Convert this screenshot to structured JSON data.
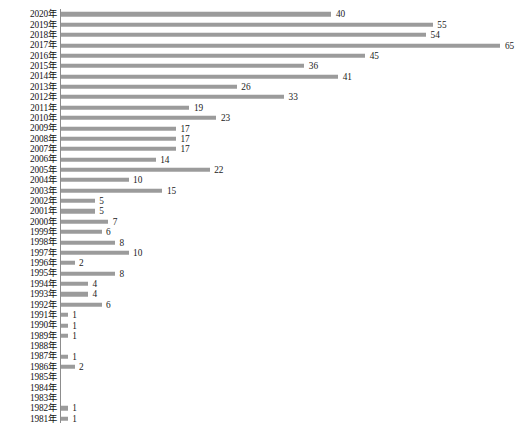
{
  "chart_data": {
    "type": "bar",
    "orientation": "horizontal",
    "title": "",
    "subtitle": "",
    "xlabel": "",
    "ylabel": "",
    "grid": false,
    "legend": null,
    "axis_spine": "left-vertical",
    "value_labels": true,
    "bar_color": "#9b9b9b",
    "text_color": "#1a1a1a",
    "axis_color": "#8d8d8d",
    "xlim": [
      0,
      65
    ],
    "category_order": "descending-year",
    "categories": [
      "2020年",
      "2019年",
      "2018年",
      "2017年",
      "2016年",
      "2015年",
      "2014年",
      "2013年",
      "2012年",
      "2011年",
      "2010年",
      "2009年",
      "2008年",
      "2007年",
      "2006年",
      "2005年",
      "2004年",
      "2003年",
      "2002年",
      "2001年",
      "2000年",
      "1999年",
      "1998年",
      "1997年",
      "1996年",
      "1995年",
      "1994年",
      "1993年",
      "1992年",
      "1991年",
      "1990年",
      "1989年",
      "1988年",
      "1987年",
      "1986年",
      "1985年",
      "1984年",
      "1983年",
      "1982年",
      "1981年"
    ],
    "values": [
      40,
      55,
      54,
      65,
      45,
      36,
      41,
      26,
      33,
      19,
      23,
      17,
      17,
      17,
      14,
      22,
      10,
      15,
      5,
      5,
      7,
      6,
      8,
      10,
      2,
      8,
      4,
      4,
      6,
      1,
      1,
      1,
      0,
      1,
      2,
      0,
      0,
      0,
      1,
      1
    ],
    "value_label_text": [
      "40",
      "55",
      "54",
      "65",
      "45",
      "36",
      "41",
      "26",
      "33",
      "19",
      "23",
      "17",
      "17",
      "17",
      "14",
      "22",
      "10",
      "15",
      "5",
      "5",
      "7",
      "6",
      "8",
      "10",
      "2",
      "8",
      "4",
      "4",
      "6",
      "1",
      "1",
      "1",
      "",
      "1",
      "2",
      "",
      "",
      "",
      "1",
      "1"
    ]
  },
  "caption": {
    "text": ""
  }
}
